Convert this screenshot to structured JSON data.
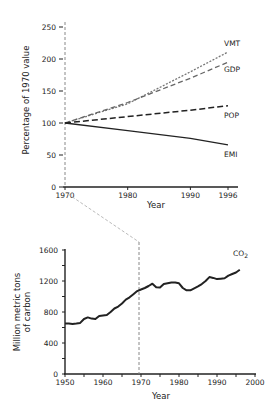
{
  "chart_data": [
    {
      "type": "line",
      "title": "",
      "xlabel": "Year",
      "ylabel": "Percentage of 1970 value",
      "xlim": [
        1970,
        1996
      ],
      "ylim": [
        0,
        250
      ],
      "x_ticks": [
        "1970",
        "1980",
        "1990",
        "1996"
      ],
      "y_ticks": [
        "0",
        "50",
        "100",
        "150",
        "200",
        "250"
      ],
      "grid": false,
      "legend": "inline labels at line ends",
      "x": [
        1970,
        1980,
        1990,
        1996
      ],
      "series": [
        {
          "name": "VMT",
          "style": "dotted-gray",
          "values": [
            100,
            130,
            180,
            211
          ]
        },
        {
          "name": "GDP",
          "style": "dashed-gray",
          "values": [
            100,
            132,
            170,
            195
          ]
        },
        {
          "name": "POP",
          "style": "dashed-black",
          "values": [
            100,
            110,
            120,
            127
          ]
        },
        {
          "name": "EMI",
          "style": "solid-black",
          "values": [
            100,
            88,
            76,
            66
          ]
        }
      ]
    },
    {
      "type": "line",
      "title": "",
      "xlabel": "Year",
      "ylabel": "Million metric tons of carbon",
      "xlim": [
        1950,
        2000
      ],
      "ylim": [
        0,
        1600
      ],
      "x_ticks": [
        "1950",
        "1960",
        "1970",
        "1980",
        "1990",
        "2000"
      ],
      "y_ticks": [
        "0",
        "400",
        "800",
        "1200",
        "1600"
      ],
      "grid": false,
      "annotation": "Dashed vertical line at 1970 linked to upper chart's 1970 axis",
      "series": [
        {
          "name": "CO2",
          "x": [
            1950,
            1951,
            1952,
            1953,
            1954,
            1955,
            1956,
            1957,
            1958,
            1959,
            1960,
            1961,
            1962,
            1963,
            1964,
            1965,
            1966,
            1967,
            1968,
            1969,
            1970,
            1971,
            1972,
            1973,
            1974,
            1975,
            1976,
            1977,
            1978,
            1979,
            1980,
            1981,
            1982,
            1983,
            1984,
            1985,
            1986,
            1987,
            1988,
            1989,
            1990,
            1991,
            1992,
            1993,
            1994,
            1995,
            1996
          ],
          "values": [
            650,
            650,
            645,
            650,
            660,
            710,
            730,
            715,
            710,
            750,
            755,
            760,
            800,
            845,
            870,
            910,
            960,
            990,
            1030,
            1070,
            1090,
            1110,
            1135,
            1165,
            1120,
            1115,
            1160,
            1170,
            1180,
            1180,
            1170,
            1110,
            1080,
            1080,
            1105,
            1130,
            1160,
            1200,
            1250,
            1240,
            1225,
            1230,
            1235,
            1270,
            1290,
            1310,
            1345
          ]
        }
      ]
    }
  ],
  "labels": {
    "top_ylabel": "Percentage of 1970 value",
    "top_xlabel": "Year",
    "bottom_ylabel_line1": "Million metric tons",
    "bottom_ylabel_line2": "of carbon",
    "bottom_xlabel": "Year",
    "co2_main": "CO",
    "co2_sub": "2"
  }
}
